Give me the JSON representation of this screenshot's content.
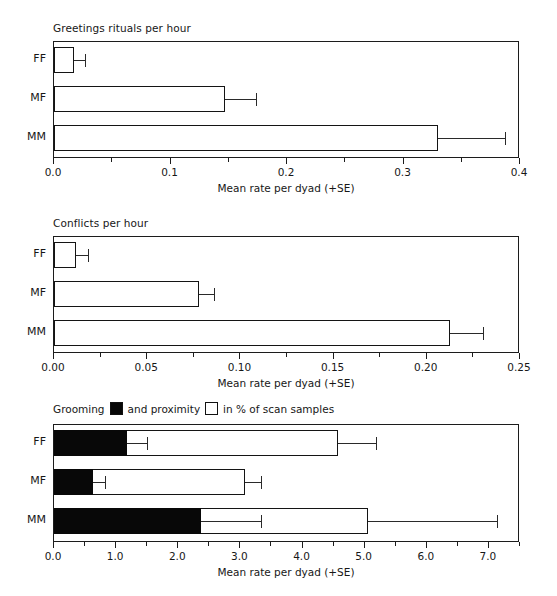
{
  "figure": {
    "axis_title": "Mean rate per dyad (+SE)",
    "categories": [
      "FF",
      "MF",
      "MM"
    ]
  },
  "panels": [
    {
      "title": "Greetings rituals per hour",
      "xlim": [
        0,
        0.4
      ],
      "xticks": [
        0.0,
        0.05,
        0.1,
        0.15,
        0.2,
        0.25,
        0.3,
        0.35,
        0.4
      ],
      "xticklabels": [
        "0.0",
        "",
        "0.1",
        "",
        "0.2",
        "",
        "0.3",
        "",
        "0.4"
      ],
      "axis_title": "Mean rate per dyad (+SE)"
    },
    {
      "title": "Conflicts per hour",
      "xlim": [
        0,
        0.25
      ],
      "xticks": [
        0.0,
        0.025,
        0.05,
        0.075,
        0.1,
        0.125,
        0.15,
        0.175,
        0.2,
        0.225,
        0.25
      ],
      "xticklabels": [
        "0.00",
        "",
        "0.05",
        "",
        "0.10",
        "",
        "0.15",
        "",
        "0.20",
        "",
        "0.25"
      ],
      "axis_title": "Mean rate per dyad (+SE)"
    },
    {
      "title_parts": {
        "lead": "Grooming",
        "middle": "and proximity",
        "tail": "in % of scan samples"
      },
      "xlim": [
        0,
        7.5
      ],
      "xticks": [
        0.0,
        0.5,
        1.0,
        1.5,
        2.0,
        2.5,
        3.0,
        3.5,
        4.0,
        4.5,
        5.0,
        5.5,
        6.0,
        6.5,
        7.0,
        7.5
      ],
      "xticklabels": [
        "0.0",
        "",
        "1.0",
        "",
        "2.0",
        "",
        "3.0",
        "",
        "4.0",
        "",
        "5.0",
        "",
        "6.0",
        "",
        "7.0",
        ""
      ],
      "axis_title": "Mean rate per dyad (+SE)"
    }
  ],
  "chart_data": [
    {
      "type": "bar",
      "orientation": "horizontal",
      "title": "Greetings rituals per hour",
      "xlabel": "Mean rate per dyad (+SE)",
      "ylabel": "",
      "categories": [
        "FF",
        "MF",
        "MM"
      ],
      "values": [
        0.017,
        0.147,
        0.33
      ],
      "errors": [
        0.01,
        0.026,
        0.057
      ],
      "error_upper": [
        0.027,
        0.173,
        0.387
      ],
      "xlim": [
        0.0,
        0.4
      ],
      "xticks": [
        0.0,
        0.1,
        0.2,
        0.3,
        0.4
      ],
      "grid": false,
      "legend": null,
      "bar_fill": "#ffffff",
      "bar_edge": "#141414"
    },
    {
      "type": "bar",
      "orientation": "horizontal",
      "title": "Conflicts per hour",
      "xlabel": "Mean rate per dyad (+SE)",
      "ylabel": "",
      "categories": [
        "FF",
        "MF",
        "MM"
      ],
      "values": [
        0.012,
        0.078,
        0.2125
      ],
      "errors": [
        0.006,
        0.008,
        0.0175
      ],
      "error_upper": [
        0.018,
        0.086,
        0.23
      ],
      "xlim": [
        0.0,
        0.25
      ],
      "xticks": [
        0.0,
        0.05,
        0.1,
        0.15,
        0.2,
        0.25
      ],
      "grid": false,
      "legend": null,
      "bar_fill": "#ffffff",
      "bar_edge": "#141414"
    },
    {
      "type": "bar",
      "orientation": "horizontal",
      "stacked": true,
      "title": "Grooming and proximity in % of scan samples",
      "xlabel": "Mean rate per dyad (+SE)",
      "ylabel": "",
      "categories": [
        "FF",
        "MF",
        "MM"
      ],
      "series": [
        {
          "name": "Grooming",
          "color": "#080808",
          "values": [
            1.18,
            0.63,
            2.37
          ],
          "error_upper": [
            1.5,
            0.82,
            3.33
          ]
        },
        {
          "name": "proximity",
          "color": "#ffffff",
          "values": [
            4.57,
            3.07,
            5.05
          ],
          "error_upper": [
            5.18,
            3.33,
            7.13
          ]
        }
      ],
      "xlim": [
        0.0,
        7.5
      ],
      "xticks": [
        0.0,
        1.0,
        2.0,
        3.0,
        4.0,
        5.0,
        6.0,
        7.0
      ],
      "grid": false,
      "legend_position": "above-plot",
      "legend": [
        "Grooming",
        "proximity"
      ]
    }
  ]
}
